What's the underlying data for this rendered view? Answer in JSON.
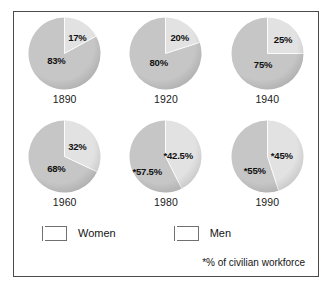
{
  "chart_data": {
    "type": "pie",
    "title": "",
    "legend": [
      {
        "label": "Women",
        "color": "#e2e2e2"
      },
      {
        "label": "Men",
        "color": "#c6c6c6"
      }
    ],
    "legend_position": "bottom-left",
    "footnote": "*% of civilian workforce",
    "series": [
      {
        "name": "Women",
        "values": [
          17,
          20,
          25,
          32,
          42.5,
          45
        ]
      },
      {
        "name": "Men",
        "values": [
          83,
          80,
          75,
          68,
          57.5,
          55
        ]
      }
    ],
    "categories": [
      "1890",
      "1920",
      "1940",
      "1960",
      "1980",
      "1990"
    ],
    "charts": [
      {
        "year": "1890",
        "women_label": "17%",
        "women_value": 17,
        "men_label": "83%",
        "men_value": 83,
        "women_label_x": 41,
        "women_label_y": 17,
        "men_label_x": 20,
        "men_label_y": 40
      },
      {
        "year": "1920",
        "women_label": "20%",
        "women_value": 20,
        "men_label": "80%",
        "men_value": 80,
        "women_label_x": 42,
        "women_label_y": 17,
        "men_label_x": 21,
        "men_label_y": 42
      },
      {
        "year": "1940",
        "women_label": "25%",
        "women_value": 25,
        "men_label": "75%",
        "men_value": 75,
        "women_label_x": 44,
        "women_label_y": 19,
        "men_label_x": 24,
        "men_label_y": 44
      },
      {
        "year": "1960",
        "women_label": "32%",
        "women_value": 32,
        "men_label": "68%",
        "men_value": 68,
        "women_label_x": 41,
        "women_label_y": 23,
        "men_label_x": 20,
        "men_label_y": 45
      },
      {
        "year": "1980",
        "women_label": "*42.5%",
        "women_value": 42.5,
        "men_label": "*57.5%",
        "men_value": 57.5,
        "women_label_x": 35,
        "women_label_y": 32,
        "men_label_x": 4,
        "men_label_y": 48
      },
      {
        "year": "1990",
        "women_label": "*45%",
        "women_value": 45,
        "men_label": "*55%",
        "men_value": 55,
        "women_label_x": 41,
        "women_label_y": 32,
        "men_label_x": 14,
        "men_label_y": 47
      }
    ]
  }
}
